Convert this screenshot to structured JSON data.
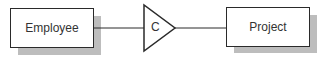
{
  "diagram": {
    "entities": [
      {
        "id": "employee",
        "label": "Employee"
      },
      {
        "id": "project",
        "label": "Project"
      }
    ],
    "relationship": {
      "symbol": "C",
      "shape": "triangle"
    },
    "connections": [
      {
        "from": "employee",
        "to": "relationship"
      },
      {
        "from": "relationship",
        "to": "project"
      }
    ]
  }
}
